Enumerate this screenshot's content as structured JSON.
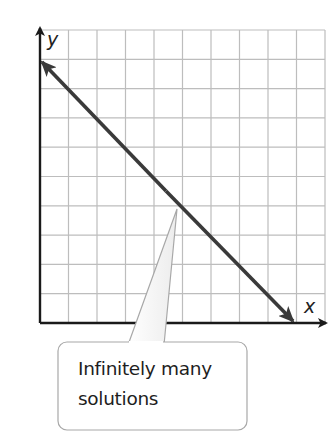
{
  "graph": {
    "x_axis_label": "x",
    "y_axis_label": "y",
    "grid": {
      "columns": 10,
      "rows": 10
    },
    "line": {
      "description": "Line with slope -1 with arrows at both ends",
      "start_grid": [
        0,
        9
      ],
      "end_grid": [
        9,
        0
      ],
      "color": "#3a3a3a"
    }
  },
  "callout": {
    "line1": "Infinitely many",
    "line2": "solutions"
  },
  "colors": {
    "grid": "#bdbdbd",
    "axis": "#1a1a1a",
    "line": "#3a3a3a",
    "callout_border": "#a8a8a8"
  }
}
